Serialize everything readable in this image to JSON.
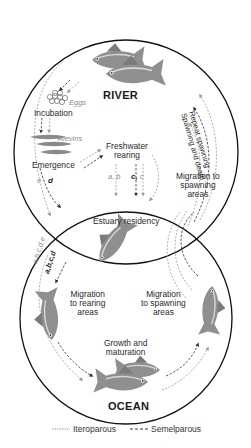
{
  "diagram": {
    "title_river": "RIVER",
    "title_ocean": "OCEAN",
    "river_stages": {
      "eggs": "Eggs",
      "incubation": "Incubation",
      "alevins": "Alevins",
      "emergence": "Emergence",
      "freshwater_rearing_line1": "Freshwater",
      "freshwater_rearing_line2": "rearing",
      "code_ab": "a, b",
      "code_c_semel": "c,",
      "code_c_itero": "c",
      "code_e": "e",
      "code_d": "d",
      "migration_spawning_line1": "Migration to",
      "migration_spawning_line2": "spawning",
      "migration_spawning_line3": "areas",
      "repeat_spawning": "Repeat spawning",
      "spawning_and_death": "Spawning and death"
    },
    "estuary": {
      "label": "Estuary residency"
    },
    "ocean_stages": {
      "code_abcde": "a,b,c,d,e",
      "code_abcd": "a,b,c,d",
      "migration_rearing_line1": "Migration",
      "migration_rearing_line2": "to rearing",
      "migration_rearing_line3": "areas",
      "migration_spawning_line1": "Migration",
      "migration_spawning_line2": "to spawning",
      "migration_spawning_line3": "areas",
      "growth_line1": "Growth and",
      "growth_line2": "maturation"
    },
    "colors": {
      "circle_stroke": "#111111",
      "iteroparous_line": "#9a9a9a",
      "semelparous_line": "#333333",
      "fish_body": "#8f8f8f",
      "fish_dark": "#6a6a6a",
      "fish_light": "#c9c9c9"
    }
  },
  "legend": {
    "iteroparous": "Iteroparous",
    "semelparous": "Semelparous"
  }
}
